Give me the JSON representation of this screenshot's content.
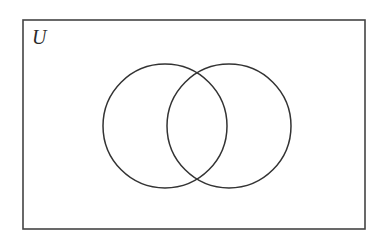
{
  "diagram": {
    "type": "venn",
    "universe_label": "U",
    "sets": [
      {
        "name": "left-circle",
        "cx": 165,
        "cy": 126,
        "r": 62
      },
      {
        "name": "right-circle",
        "cx": 229,
        "cy": 126,
        "r": 62
      }
    ],
    "stroke_color": "#333333",
    "background": "#ffffff"
  }
}
